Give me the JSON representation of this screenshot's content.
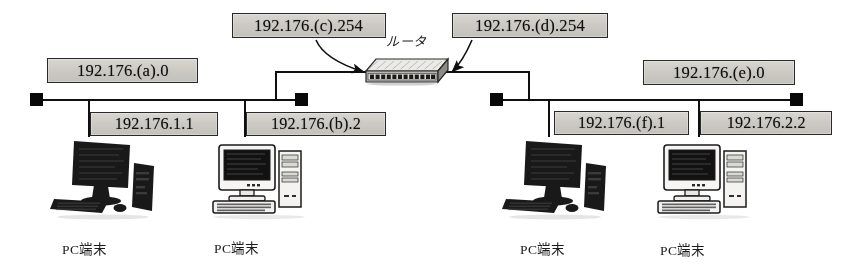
{
  "diagram": {
    "title_text": "",
    "router_label": "ルータ",
    "colors": {
      "line": "#111111",
      "label_fill": "#cbc9c3",
      "label_border": "#2b2b2b",
      "dark_pc": "#1a1a1a",
      "light_pc": "#f2f2f0"
    },
    "ip_labels": [
      {
        "id": "net-left",
        "text": "192.176.(a).0"
      },
      {
        "id": "router-left",
        "text": "192.176.(c).254"
      },
      {
        "id": "router-right",
        "text": "192.176.(d).254"
      },
      {
        "id": "net-right",
        "text": "192.176.(e).0"
      },
      {
        "id": "host-left-1",
        "text": "192.176.1.1"
      },
      {
        "id": "host-left-2",
        "text": "192.176.(b).2"
      },
      {
        "id": "host-right-1",
        "text": "192.176.(f).1"
      },
      {
        "id": "host-right-2",
        "text": "192.176.2.2"
      }
    ],
    "terminals": [
      {
        "id": "pc-1",
        "label": "PC端末"
      },
      {
        "id": "pc-2",
        "label": "PC端末"
      },
      {
        "id": "pc-3",
        "label": "PC端末"
      },
      {
        "id": "pc-4",
        "label": "PC端末"
      }
    ],
    "icons": {
      "router": "router-icon",
      "bus_terminator": "bus-terminator-icon",
      "pc_dark": "pc-flatpanel-icon",
      "pc_light": "pc-crt-icon",
      "callout_arrow": "callout-arrow-icon"
    }
  }
}
